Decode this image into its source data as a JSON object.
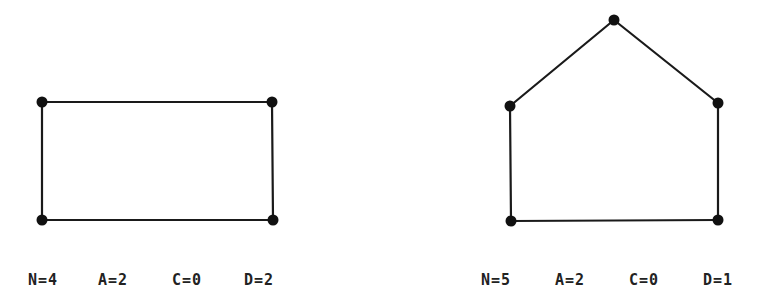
{
  "figures": [
    {
      "name": "square-graph",
      "nodes": [
        [
          42,
          102
        ],
        [
          272,
          102
        ],
        [
          42,
          220
        ],
        [
          273,
          220
        ]
      ],
      "edges": [
        [
          0,
          1
        ],
        [
          0,
          2
        ],
        [
          1,
          3
        ],
        [
          2,
          3
        ]
      ],
      "stats": {
        "n": "N=4",
        "a": "A=2",
        "c": "C=0",
        "d": "D=2"
      }
    },
    {
      "name": "pentagon-graph",
      "nodes": [
        [
          614,
          20
        ],
        [
          510,
          106
        ],
        [
          718,
          103
        ],
        [
          511,
          221
        ],
        [
          718,
          220
        ]
      ],
      "edges": [
        [
          0,
          1
        ],
        [
          0,
          2
        ],
        [
          1,
          3
        ],
        [
          2,
          4
        ],
        [
          3,
          4
        ]
      ],
      "stats": {
        "n": "N=5",
        "a": "A=2",
        "c": "C=0",
        "d": "D=1"
      }
    }
  ],
  "colors": {
    "ink": "#111111",
    "background": "#ffffff"
  }
}
